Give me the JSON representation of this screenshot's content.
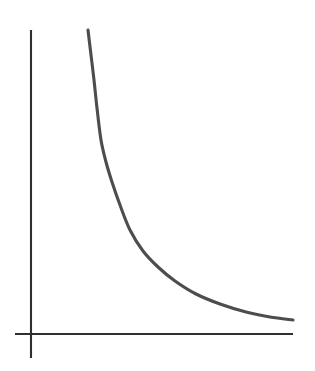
{
  "figure": {
    "title": "",
    "caption": "",
    "background_color": "#ffffff",
    "width": 315,
    "height": 371
  },
  "chart_data": {
    "type": "line",
    "title": "",
    "subtitle": "",
    "xlabel": "",
    "ylabel": "",
    "legend": [],
    "legend_position": "none",
    "grid": false,
    "annotations": [],
    "xtick_labels": [],
    "ytick_labels": [],
    "xlim": [
      0,
      10
    ],
    "ylim": [
      0,
      10
    ],
    "description": "Smooth decreasing convex curve resembling inverse or exponential decay, drawn with two plain axis lines and no tick marks or labels.",
    "axes": {
      "y_axis": {
        "x_px": 31,
        "y_top_px": 30,
        "y_bottom_px": 358,
        "color": "#2f2f2f",
        "width_px": 2
      },
      "x_axis": {
        "y_px": 334,
        "x_left_px": 15,
        "x_right_px": 293,
        "color": "#2f2f2f",
        "width_px": 2
      }
    },
    "series": [
      {
        "name": "decay",
        "color": "#4d4d4d",
        "stroke_width_px": 3,
        "points_px": [
          [
            88,
            30
          ],
          [
            91,
            55
          ],
          [
            94,
            80
          ],
          [
            97,
            108
          ],
          [
            101,
            140
          ],
          [
            106,
            162
          ],
          [
            112,
            182
          ],
          [
            120,
            205
          ],
          [
            130,
            230
          ],
          [
            143,
            251
          ],
          [
            158,
            267
          ],
          [
            175,
            281
          ],
          [
            196,
            294
          ],
          [
            220,
            304
          ],
          [
            246,
            312
          ],
          [
            270,
            317
          ],
          [
            293,
            320
          ]
        ],
        "x": [
          0.8,
          1.0,
          1.2,
          1.4,
          1.7,
          2.0,
          2.3,
          2.7,
          3.2,
          3.8,
          4.4,
          5.2,
          6.0,
          6.9,
          7.9,
          8.9,
          10.0
        ],
        "y": [
          10.0,
          9.2,
          8.4,
          7.5,
          6.4,
          5.7,
          5.0,
          4.3,
          3.5,
          2.8,
          2.3,
          1.8,
          1.3,
          1.0,
          0.8,
          0.6,
          0.5
        ]
      }
    ]
  }
}
